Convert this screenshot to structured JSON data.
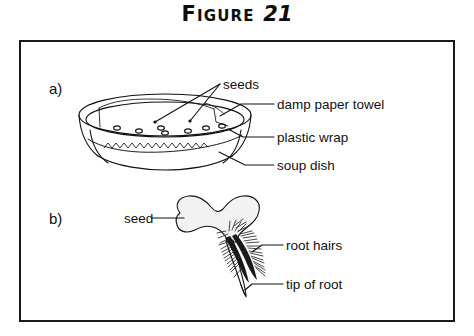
{
  "figure": {
    "title_word": "Figure",
    "title_number": "21",
    "title_full": "FIGURE 21"
  },
  "parts": [
    {
      "id": "a",
      "letter": "a)",
      "caption": "soup dish germination setup"
    },
    {
      "id": "b",
      "letter": "b)",
      "caption": "germinated seed with root"
    }
  ],
  "part_a": {
    "letter": "a)",
    "labels": [
      {
        "name": "seeds",
        "text": "seeds"
      },
      {
        "name": "damp-paper-towel",
        "text": "damp paper towel"
      },
      {
        "name": "plastic-wrap",
        "text": "plastic wrap"
      },
      {
        "name": "soup-dish",
        "text": "soup dish"
      }
    ],
    "seed_count_visible": 7
  },
  "part_b": {
    "letter": "b)",
    "labels": [
      {
        "name": "seed",
        "text": "seed"
      },
      {
        "name": "root-hairs",
        "text": "root hairs"
      },
      {
        "name": "tip-of-root",
        "text": "tip of root"
      }
    ]
  },
  "colors": {
    "ink": "#111111",
    "frame": "#1a1a1a",
    "paper": "#ffffff",
    "seed_fill": "#f2f2f2",
    "root_hair": "#1a1a1a"
  }
}
